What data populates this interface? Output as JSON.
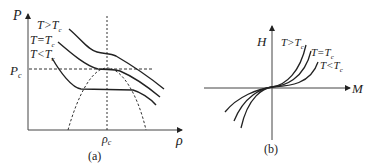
{
  "panel_a": {
    "caption": "(a)",
    "y_axis_label": "P",
    "x_axis_label": "ρ",
    "critical_pressure_label": "P",
    "critical_pressure_sub": "c",
    "critical_density_label": "ρ",
    "critical_density_sub": "c",
    "curves": [
      {
        "label": "T>T",
        "sub": "c"
      },
      {
        "label": "T=T",
        "sub": "c"
      },
      {
        "label": "T<T",
        "sub": "c"
      }
    ]
  },
  "panel_b": {
    "caption": "(b)",
    "y_axis_label": "H",
    "x_axis_label": "M",
    "curves": [
      {
        "label": "T>T",
        "sub": "c"
      },
      {
        "label": "T=T",
        "sub": "c"
      },
      {
        "label": "T<T",
        "sub": "c"
      }
    ]
  },
  "colors": {
    "ink": "#222222",
    "background": "#ffffff"
  }
}
